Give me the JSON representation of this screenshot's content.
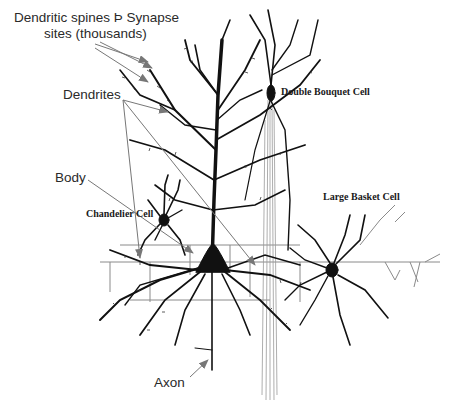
{
  "diagram": {
    "labels": {
      "spines_line1": "Dendritic spines Þ  Synapse",
      "spines_line2": "sites  (thousands)",
      "dendrites": "Dendrites",
      "body": "Body",
      "axon": "Axon"
    },
    "cell_types": {
      "double_bouquet": "Double Bouquet Cell",
      "chandelier": "Chandelier Cell",
      "large_basket": "Large Basket Cell"
    },
    "colors": {
      "ink": "#111111",
      "arrow": "#777777",
      "faint_axon": "#8a8a8a",
      "label_text": "#2a2a2a"
    }
  }
}
